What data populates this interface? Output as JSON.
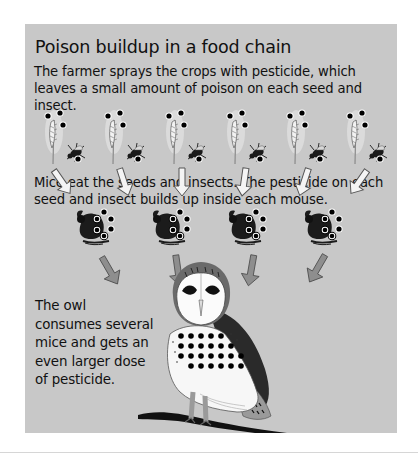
{
  "figure": {
    "title": "Poison buildup in a food chain",
    "step1_text": "The farmer sprays the crops with pesticide, which leaves a small amount of poison on each seed and insect.",
    "step2_text": "Mice eat the seeds and insects. The pesticide on each seed and insect builds up inside each mouse.",
    "step3_text": "The owl consumes several mice and gets an even larger dose of pesticide.",
    "colors": {
      "panel_bg": "#c8c8c8",
      "poison_dot": "#000000",
      "owl_wing": "#2a2a2a",
      "arrow_white": "#f4f4f4",
      "arrow_gray": "#8e8e8e"
    },
    "levels": [
      {
        "name": "crops-and-insects",
        "count": 6,
        "poison_dots_each": 4,
        "icons": [
          "wheat-seed-icon",
          "insect-icon"
        ]
      },
      {
        "name": "mice",
        "count": 4,
        "poison_dots_each": 6,
        "icons": [
          "mouse-icon"
        ]
      },
      {
        "name": "owl",
        "count": 1,
        "poison_dots_each": 24,
        "icons": [
          "barn-owl-icon"
        ]
      }
    ]
  }
}
